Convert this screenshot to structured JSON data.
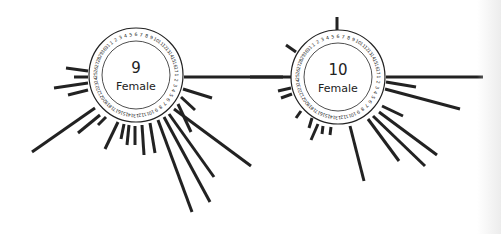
{
  "figure": {
    "ink_color": "#222222",
    "background": "#ffffff"
  },
  "chart_data": {
    "type": "radial-ray-diagram",
    "title": "",
    "dials": [
      {
        "id": "dial-9",
        "number": "9",
        "label": "Female",
        "center": [
          136,
          75
        ],
        "radius": 47,
        "rim_labels_visible": [
          "1",
          "2",
          "3",
          "4",
          "24",
          "25",
          "26",
          "27",
          "28"
        ],
        "rays": [
          {
            "from": [
              88,
              71
            ],
            "to": [
              66,
              68
            ]
          },
          {
            "from": [
              88,
              77
            ],
            "to": [
              74,
              77
            ]
          },
          {
            "from": [
              88,
              83
            ],
            "to": [
              54,
              88
            ]
          },
          {
            "from": [
              88,
              90
            ],
            "to": [
              68,
              95
            ]
          },
          {
            "from": [
              95,
              108
            ],
            "to": [
              32,
              152
            ]
          },
          {
            "from": [
              100,
              115
            ],
            "to": [
              78,
              133
            ]
          },
          {
            "from": [
              106,
              117
            ],
            "to": [
              98,
              125
            ]
          },
          {
            "from": [
              118,
              122
            ],
            "to": [
              105,
              149
            ]
          },
          {
            "from": [
              124,
              124
            ],
            "to": [
              121,
              139
            ]
          },
          {
            "from": [
              129,
              125
            ],
            "to": [
              127,
              145
            ]
          },
          {
            "from": [
              135,
              126
            ],
            "to": [
              135,
              145
            ]
          },
          {
            "from": [
              142,
              125
            ],
            "to": [
              144,
              155
            ]
          },
          {
            "from": [
              150,
              123
            ],
            "to": [
              155,
              153
            ]
          },
          {
            "from": [
              158,
              120
            ],
            "to": [
              192,
              212
            ]
          },
          {
            "from": [
              164,
              117
            ],
            "to": [
              210,
              202
            ]
          },
          {
            "from": [
              169,
              114
            ],
            "to": [
              214,
              177
            ]
          },
          {
            "from": [
              174,
              109
            ],
            "to": [
              251,
              166
            ]
          },
          {
            "from": [
              178,
              104
            ],
            "to": [
              191,
              132
            ]
          },
          {
            "from": [
              181,
              97
            ],
            "to": [
              195,
              110
            ]
          },
          {
            "from": [
              183,
              89
            ],
            "to": [
              212,
              98
            ]
          },
          {
            "from": [
              184,
              77
            ],
            "to": [
              283,
              77
            ]
          }
        ]
      },
      {
        "id": "dial-10",
        "number": "10",
        "label": "Female",
        "center": [
          338,
          77
        ],
        "radius": 47,
        "rim_labels_visible": [
          "1",
          "2",
          "3",
          "4",
          "24",
          "25",
          "26",
          "27",
          "28"
        ],
        "rays": [
          {
            "from": [
              337,
              30
            ],
            "to": [
              337,
              17
            ]
          },
          {
            "from": [
              296,
              52
            ],
            "to": [
              286,
              45
            ]
          },
          {
            "from": [
              291,
              77
            ],
            "to": [
              250,
              77
            ]
          },
          {
            "from": [
              291,
              88
            ],
            "to": [
              278,
              91
            ]
          },
          {
            "from": [
              292,
              94
            ],
            "to": [
              281,
              98
            ]
          },
          {
            "from": [
              301,
              111
            ],
            "to": [
              296,
              118
            ]
          },
          {
            "from": [
              312,
              118
            ],
            "to": [
              309,
              128
            ]
          },
          {
            "from": [
              318,
              124
            ],
            "to": [
              311,
              140
            ]
          },
          {
            "from": [
              323,
              126
            ],
            "to": [
              322,
              134
            ]
          },
          {
            "from": [
              331,
              127
            ],
            "to": [
              330,
              135
            ]
          },
          {
            "from": [
              350,
              126
            ],
            "to": [
              364,
              181
            ]
          },
          {
            "from": [
              368,
              119
            ],
            "to": [
              399,
              161
            ]
          },
          {
            "from": [
              373,
              116
            ],
            "to": [
              425,
              166
            ]
          },
          {
            "from": [
              379,
              112
            ],
            "to": [
              437,
              155
            ]
          },
          {
            "from": [
              382,
              106
            ],
            "to": [
              403,
              116
            ]
          },
          {
            "from": [
              385,
              89
            ],
            "to": [
              460,
              109
            ]
          },
          {
            "from": [
              386,
              82
            ],
            "to": [
              416,
              87
            ]
          },
          {
            "from": [
              386,
              77
            ],
            "to": [
              483,
              77
            ]
          }
        ]
      }
    ]
  }
}
